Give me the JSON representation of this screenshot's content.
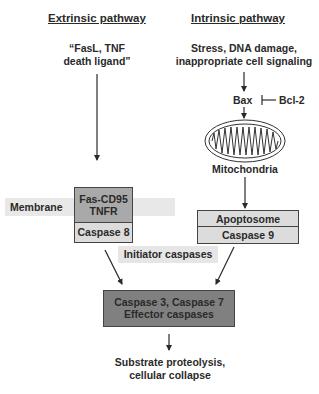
{
  "diagram": {
    "extrinsic": {
      "title": "Extrinsic pathway",
      "trigger": [
        "“FasL, TNF",
        "death ligand”"
      ],
      "receptor_box": {
        "top_lines": [
          "Fas-CD95",
          "TNFR"
        ],
        "bottom": "Caspase 8"
      }
    },
    "intrinsic": {
      "title": "Intrinsic pathway",
      "trigger": [
        "Stress, DNA damage,",
        "inappropriate cell signaling"
      ],
      "bax": "Bax",
      "inhibitor": "Bcl-2",
      "organelle_label": "Mitochondria",
      "apoptosome_box": {
        "top": "Apoptosome",
        "bottom": "Caspase 9"
      }
    },
    "membrane_label": "Membrane",
    "initiator_label": "Initiator caspases",
    "effector_box": [
      "Caspase 3, Caspase 7",
      "Effector caspases"
    ],
    "outcome": [
      "Substrate proteolysis,",
      "cellular collapse"
    ],
    "colors": {
      "band": "#e6e6e6",
      "receptor_top": "#a9a9a9",
      "light_box": "#dcdcdc",
      "effector": "#7f7f7f",
      "line": "#2a2a2a"
    }
  }
}
